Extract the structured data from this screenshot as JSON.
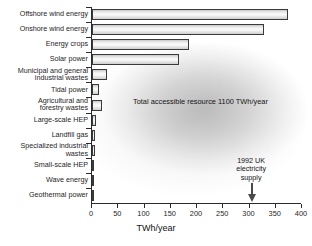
{
  "chart_data": {
    "type": "bar",
    "orientation": "horizontal",
    "title": "",
    "xlabel": "TWh/year",
    "ylabel": "",
    "xlim": [
      0,
      400
    ],
    "xticks": [
      0,
      50,
      100,
      150,
      200,
      250,
      300,
      350,
      400
    ],
    "grid": false,
    "legend": null,
    "categories": [
      "Offshore wind energy",
      "Onshore wind energy",
      "Energy crops",
      "Solar power",
      "Municipal and general\nindustrial wastes",
      "Tidal power",
      "Agricultural and\nforestry wastes",
      "Large-scale HEP",
      "Landfill gas",
      "Specialized industrial\nwastes",
      "Small-scale HEP",
      "Wave energy",
      "Geothermal power"
    ],
    "values": [
      373,
      328,
      185,
      165,
      29,
      13,
      19,
      7,
      6,
      5,
      4,
      3,
      1
    ],
    "annotations": [
      {
        "name": "total-resource-note",
        "text": "Total accessible resource 1100 TWh/year",
        "value": 1100
      },
      {
        "name": "uk-supply-arrow",
        "text": "1992 UK\nelectricity\nsupply",
        "x_value": 305
      }
    ]
  },
  "axis": {
    "x_title": "TWh/year",
    "tick_labels": [
      "0",
      "50",
      "100",
      "150",
      "200",
      "250",
      "300",
      "350",
      "400"
    ]
  },
  "notes": {
    "total_resource": "Total accessible resource 1100 TWh/year",
    "uk_supply_line1": "1992 UK",
    "uk_supply_line2": "electricity",
    "uk_supply_line3": "supply"
  },
  "colors": {
    "axis": "#2b2b2b",
    "bar_edge": "#3a3a3a",
    "bar_fill": "#efefef",
    "text": "#141414",
    "arrow": "#4a4a4a"
  }
}
